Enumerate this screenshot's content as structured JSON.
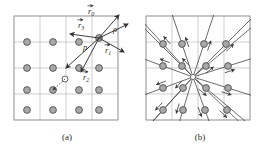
{
  "figure": {
    "background": "#ffffff",
    "width": 259,
    "height": 154
  },
  "style": {
    "grid_line_color": "#b9b9b9",
    "frame_color": "#9e9e9e",
    "atom_fill": "#a8a8a8",
    "atom_stroke": "#4a4a4a",
    "open_atom_fill": "#ffffff",
    "open_atom_stroke": "#4a4a4a",
    "vector_color": "#333333",
    "ray_color": "#3c3c3c",
    "label_color": "#2b2b2b",
    "atom_radius": 3.4,
    "open_atom_radius": 3.0
  },
  "panels": [
    {
      "id": "a",
      "caption": "(a)",
      "frame": {
        "x": 14,
        "y": 16,
        "w": 104,
        "h": 104
      },
      "grid": {
        "columns": 4,
        "rows": 4,
        "x_lines": [
          14,
          40,
          66,
          92,
          118
        ],
        "y_lines": [
          16,
          42,
          68,
          94,
          120
        ]
      },
      "atoms": [
        {
          "cx": 27,
          "cy": 42,
          "type": "filled"
        },
        {
          "cx": 53,
          "cy": 42,
          "type": "filled"
        },
        {
          "cx": 79,
          "cy": 42,
          "type": "filled"
        },
        {
          "cx": 99,
          "cy": 38,
          "type": "filled"
        },
        {
          "cx": 27,
          "cy": 68,
          "type": "filled"
        },
        {
          "cx": 53,
          "cy": 68,
          "type": "filled"
        },
        {
          "cx": 79,
          "cy": 68,
          "type": "filled"
        },
        {
          "cx": 99,
          "cy": 68,
          "type": "filled"
        },
        {
          "cx": 27,
          "cy": 90,
          "type": "filled"
        },
        {
          "cx": 53,
          "cy": 90,
          "type": "filled"
        },
        {
          "cx": 79,
          "cy": 90,
          "type": "filled"
        },
        {
          "cx": 99,
          "cy": 90,
          "type": "filled"
        },
        {
          "cx": 27,
          "cy": 110,
          "type": "filled"
        },
        {
          "cx": 53,
          "cy": 110,
          "type": "filled"
        },
        {
          "cx": 79,
          "cy": 110,
          "type": "filled"
        },
        {
          "cx": 99,
          "cy": 110,
          "type": "filled"
        },
        {
          "cx": 65,
          "cy": 79,
          "type": "open"
        }
      ],
      "origin": {
        "x": 99,
        "y": 38
      },
      "vectors": [
        {
          "name": "r0",
          "label": "r⃗0",
          "symbol": "r",
          "subscript": "0",
          "x1": 99,
          "y1": 38,
          "x2": 119,
          "y2": 15,
          "label_x": 88,
          "label_y": 14
        },
        {
          "name": "r1",
          "label": "r⃗1",
          "symbol": "r",
          "subscript": "1",
          "x1": 99,
          "y1": 38,
          "x2": 124,
          "y2": 52,
          "label_x": 105,
          "label_y": 53
        },
        {
          "name": "r2",
          "label": "r⃗2",
          "symbol": "r",
          "subscript": "2",
          "x1": 99,
          "y1": 38,
          "x2": 81,
          "y2": 72,
          "label_x": 83,
          "label_y": 80
        },
        {
          "name": "r3",
          "label": "r⃗3",
          "symbol": "r",
          "subscript": "3",
          "x1": 99,
          "y1": 38,
          "x2": 70,
          "y2": 34,
          "label_x": 78,
          "label_y": 28
        },
        {
          "name": "rho",
          "label": "ρ",
          "symbol": "ρ",
          "subscript": "",
          "x1": 99,
          "y1": 38,
          "x2": 128,
          "y2": 24,
          "label_x": 113,
          "label_y": 32
        },
        {
          "name": "p",
          "label": "p",
          "symbol": "p",
          "subscript": "",
          "x1": 99,
          "y1": 38,
          "x2": 66,
          "y2": 68,
          "label_x": 83,
          "label_y": 50
        }
      ],
      "dashed_segment": {
        "x1": 65,
        "y1": 79,
        "x2": 53,
        "y2": 90
      }
    },
    {
      "id": "b",
      "caption": "(b)",
      "frame": {
        "x": 146,
        "y": 16,
        "w": 104,
        "h": 104
      },
      "grid": {
        "columns": 4,
        "rows": 4,
        "x_lines": [
          146,
          172,
          198,
          224,
          250
        ],
        "y_lines": [
          16,
          42,
          68,
          94,
          120
        ]
      },
      "center": {
        "x": 193,
        "y": 77
      },
      "atoms": [
        {
          "cx": 163,
          "cy": 44,
          "type": "filled"
        },
        {
          "cx": 182,
          "cy": 44,
          "type": "filled"
        },
        {
          "cx": 204,
          "cy": 44,
          "type": "filled"
        },
        {
          "cx": 226,
          "cy": 44,
          "type": "filled"
        },
        {
          "cx": 163,
          "cy": 66,
          "type": "filled"
        },
        {
          "cx": 182,
          "cy": 66,
          "type": "filled"
        },
        {
          "cx": 206,
          "cy": 66,
          "type": "filled"
        },
        {
          "cx": 228,
          "cy": 66,
          "type": "filled"
        },
        {
          "cx": 163,
          "cy": 88,
          "type": "filled"
        },
        {
          "cx": 183,
          "cy": 88,
          "type": "filled"
        },
        {
          "cx": 206,
          "cy": 88,
          "type": "filled"
        },
        {
          "cx": 228,
          "cy": 88,
          "type": "filled"
        },
        {
          "cx": 163,
          "cy": 110,
          "type": "filled"
        },
        {
          "cx": 183,
          "cy": 110,
          "type": "filled"
        },
        {
          "cx": 205,
          "cy": 110,
          "type": "filled"
        },
        {
          "cx": 227,
          "cy": 110,
          "type": "filled"
        }
      ],
      "rays_extend_beyond_frame": true,
      "arrow_count": 16
    }
  ],
  "captions": {
    "a": "(a)",
    "b": "(b)"
  }
}
